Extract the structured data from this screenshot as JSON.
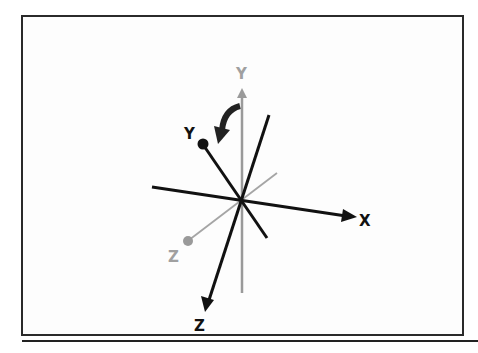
{
  "diagram": {
    "title": "",
    "labels": {
      "x_axis": "X",
      "y_axis_rotated": "Y",
      "y_axis_original": "Y",
      "z_axis_rotated": "Z",
      "z_axis_original": "Z"
    },
    "colors": {
      "rotated_axes": "#111111",
      "original_axes": "#9a9a9a",
      "frame": "#2a2a2a",
      "background": "#ffffff"
    },
    "annotations": {
      "rotation_arrow": "curved arrow indicating rotation of Y axis about X axis"
    }
  }
}
